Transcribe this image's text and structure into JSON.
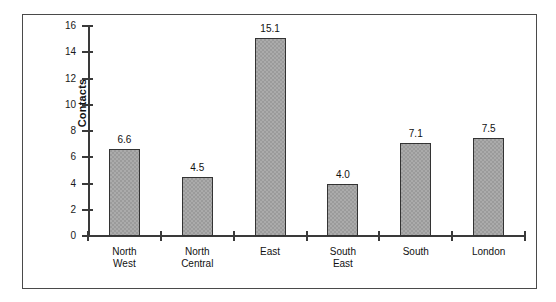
{
  "chart_data": {
    "type": "bar",
    "title": "",
    "xlabel": "",
    "ylabel": "Contacts",
    "ylim": [
      0,
      16
    ],
    "ytick_values": [
      16,
      14,
      12,
      10,
      8,
      6,
      4,
      2,
      0
    ],
    "ytick_labels": [
      "16",
      "14",
      "12",
      "10",
      "8",
      "6",
      "4",
      "2",
      "0"
    ],
    "grid": false,
    "legend": null,
    "categories": [
      "North\nWest",
      "North\nCentral",
      "East",
      "South\nEast",
      "South",
      "London"
    ],
    "values": [
      6.6,
      4.5,
      15.1,
      4.0,
      7.1,
      7.5
    ],
    "value_labels": [
      "6.6",
      "4.5",
      "15.1",
      "4.0",
      "7.1",
      "7.5"
    ],
    "bar_color": "#9b9b9b",
    "bar_edge_color": "#333333",
    "axis_color": "#3a3a3a",
    "frame_color": "#4a4a4a",
    "background_color": "#ffffff"
  }
}
